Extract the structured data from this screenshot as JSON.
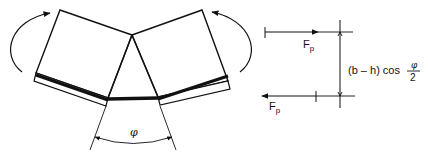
{
  "diagram": {
    "angle_symbol": "φ",
    "force_top": {
      "label": "F",
      "subscript": "p"
    },
    "force_bottom": {
      "label": "F",
      "subscript": "p"
    },
    "dimension": {
      "expression_prefix": "(b – h) cos",
      "fraction_numerator": "φ",
      "fraction_denominator": "2"
    },
    "colors": {
      "line": "#111111",
      "background": "#ffffff"
    }
  }
}
